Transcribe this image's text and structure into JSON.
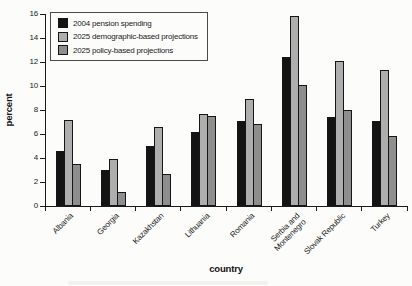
{
  "chart_data": {
    "type": "bar",
    "title": "",
    "xlabel": "country",
    "ylabel": "percent",
    "ylim": [
      0,
      16
    ],
    "yticks": [
      0,
      2,
      4,
      6,
      8,
      10,
      12,
      14,
      16
    ],
    "grid": false,
    "legend_position": "upper-left",
    "categories": [
      [
        "Albania"
      ],
      [
        "Georgia"
      ],
      [
        "Kazakhstan"
      ],
      [
        "Lithuania"
      ],
      [
        "Romania"
      ],
      [
        "Serbia and",
        "Montenegro"
      ],
      [
        "Slovak Republic"
      ],
      [
        "Turkey"
      ]
    ],
    "series": [
      {
        "name": "2004 pension spending",
        "color": "#141414",
        "values": [
          4.6,
          3.0,
          5.0,
          6.2,
          7.1,
          12.4,
          7.4,
          7.1
        ]
      },
      {
        "name": "2025 demographic-based projections",
        "color": "#aeaeae",
        "values": [
          7.2,
          3.9,
          6.6,
          7.7,
          8.9,
          15.8,
          12.1,
          11.3
        ]
      },
      {
        "name": "2025 policy-based projections",
        "color": "#8e8e8e",
        "values": [
          3.5,
          1.2,
          2.7,
          7.5,
          6.8,
          10.1,
          8.0,
          5.8
        ]
      }
    ]
  },
  "colors": {
    "axis": "#1a1a1a",
    "background": "#fcfcfa"
  }
}
